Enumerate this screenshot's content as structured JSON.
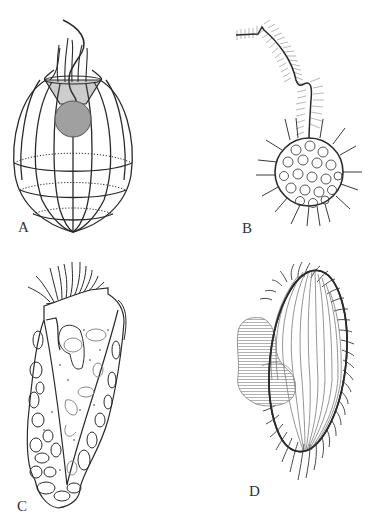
{
  "figure": {
    "type": "four-panel scientific illustration of protists",
    "background": "#ffffff",
    "line_color": "#2a2a2a",
    "shade_color": "#9a9a9a",
    "hair_color": "#b5b5b5",
    "panels": [
      {
        "id": "A",
        "label": "A",
        "description": "ovoid ribbed lorica basket with funnel collar, grey cell body and flagellum"
      },
      {
        "id": "B",
        "label": "B",
        "description": "spherical scaled cell with radiating spines and long hairy flagellum"
      },
      {
        "id": "C",
        "label": "C",
        "description": "elongate agglutinated lorica with oral ciliary crown"
      },
      {
        "id": "D",
        "label": "D",
        "description": "oval ciliated cell with longitudinal kineties and lateral shaded lobe"
      }
    ]
  }
}
